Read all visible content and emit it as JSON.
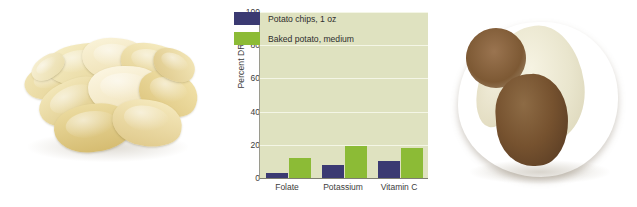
{
  "figure": {
    "left_photo": {
      "name": "potato-chips-photo",
      "alt": "Pile of golden potato chips on white background"
    },
    "right_photo": {
      "name": "baked-potato-photo",
      "alt": "Whole baked potato split open showing white flesh"
    }
  },
  "chart_data": {
    "type": "bar",
    "title": "",
    "xlabel": "",
    "ylabel": "Percent DRI*",
    "categories": [
      "Folate",
      "Potassium",
      "Vitamin C"
    ],
    "series": [
      {
        "name": "Potato chips, 1 oz",
        "color": "#3b3a72",
        "values": [
          3,
          8,
          10
        ]
      },
      {
        "name": "Baked potato, medium",
        "color": "#8cbb36",
        "values": [
          12,
          20,
          18
        ]
      }
    ],
    "ylim": [
      0,
      100
    ],
    "yticks": [
      0,
      20,
      40,
      60,
      80,
      100
    ],
    "ytick_labels": [
      "0",
      "20",
      "40",
      "60",
      "80",
      "100"
    ],
    "grid": true,
    "legend_position": "upper left",
    "plot_background": "#dfe2c0",
    "gridline_color": "#f4f6e6"
  }
}
